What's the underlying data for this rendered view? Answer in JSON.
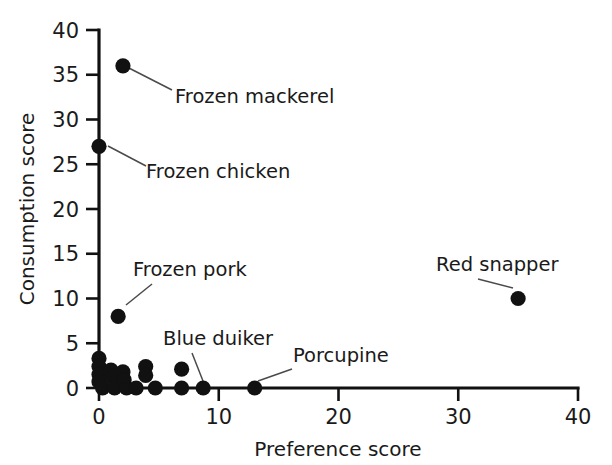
{
  "chart_data": {
    "type": "scatter",
    "title": "",
    "xlabel": "Preference score",
    "ylabel": "Consumption score",
    "xlim": [
      0,
      40
    ],
    "ylim": [
      0,
      40
    ],
    "xticks": [
      0,
      10,
      20,
      30,
      40
    ],
    "yticks": [
      0,
      5,
      10,
      15,
      20,
      25,
      30,
      35,
      40
    ],
    "xtick_labels": [
      "0",
      "10",
      "20",
      "30",
      "40"
    ],
    "ytick_labels": [
      "0",
      "5",
      "10",
      "15",
      "20",
      "25",
      "30",
      "35",
      "40"
    ],
    "grid": false,
    "legend": "none",
    "marker": "filled-circle",
    "marker_color": "#111111",
    "points": [
      {
        "x": 2.0,
        "y": 36.0,
        "label": "Frozen mackerel"
      },
      {
        "x": 0.0,
        "y": 27.0,
        "label": "Frozen chicken"
      },
      {
        "x": 1.6,
        "y": 8.0,
        "label": "Frozen pork"
      },
      {
        "x": 35.0,
        "y": 10.0,
        "label": "Red snapper"
      },
      {
        "x": 8.7,
        "y": 0.0,
        "label": "Blue duiker"
      },
      {
        "x": 13.0,
        "y": 0.0,
        "label": "Porcupine"
      },
      {
        "x": 0.0,
        "y": 3.3,
        "label": ""
      },
      {
        "x": 0.0,
        "y": 2.4,
        "label": ""
      },
      {
        "x": 0.0,
        "y": 1.5,
        "label": ""
      },
      {
        "x": 0.0,
        "y": 0.7,
        "label": ""
      },
      {
        "x": 0.3,
        "y": 0.0,
        "label": ""
      },
      {
        "x": 1.0,
        "y": 2.0,
        "label": ""
      },
      {
        "x": 1.1,
        "y": 1.2,
        "label": ""
      },
      {
        "x": 1.3,
        "y": 0.0,
        "label": ""
      },
      {
        "x": 2.0,
        "y": 1.8,
        "label": ""
      },
      {
        "x": 2.1,
        "y": 0.9,
        "label": ""
      },
      {
        "x": 2.3,
        "y": 0.0,
        "label": ""
      },
      {
        "x": 3.1,
        "y": 0.0,
        "label": ""
      },
      {
        "x": 3.9,
        "y": 2.4,
        "label": ""
      },
      {
        "x": 3.9,
        "y": 1.4,
        "label": ""
      },
      {
        "x": 4.7,
        "y": 0.0,
        "label": ""
      },
      {
        "x": 6.9,
        "y": 2.1,
        "label": ""
      },
      {
        "x": 6.9,
        "y": 0.0,
        "label": ""
      }
    ],
    "annotations": [
      {
        "label": "Frozen mackerel",
        "point_x": 2.0,
        "point_y": 36.0,
        "text_x": 175,
        "text_y": 103,
        "leader_from": [
          123,
          65
        ],
        "leader_to": [
          172,
          90
        ]
      },
      {
        "label": "Frozen chicken",
        "point_x": 0.0,
        "point_y": 27.0,
        "text_x": 146,
        "text_y": 178,
        "leader_from": [
          108,
          146
        ],
        "leader_to": [
          146,
          166
        ]
      },
      {
        "label": "Frozen pork",
        "point_x": 1.6,
        "point_y": 8.0,
        "text_x": 133,
        "text_y": 276,
        "leader_from": [
          126,
          305
        ],
        "leader_to": [
          152,
          284
        ]
      },
      {
        "label": "Red snapper",
        "point_x": 35.0,
        "point_y": 10.0,
        "text_x": 436,
        "text_y": 271,
        "leader_from": [
          513,
          288
        ],
        "leader_to": [
          478,
          279
        ]
      },
      {
        "label": "Blue duiker",
        "point_x": 8.7,
        "point_y": 0.0,
        "text_x": 163,
        "text_y": 345,
        "leader_from": [
          203,
          381
        ],
        "leader_to": [
          192,
          353
        ]
      },
      {
        "label": "Porcupine",
        "point_x": 13.0,
        "point_y": 0.0,
        "text_x": 293,
        "text_y": 362,
        "leader_from": [
          258,
          381
        ],
        "leader_to": [
          292,
          369
        ]
      }
    ]
  },
  "axes": {
    "x_title": "Preference score",
    "y_title": "Consumption score"
  }
}
